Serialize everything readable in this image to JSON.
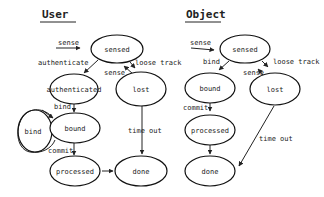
{
  "diagrams": [
    {
      "title": "User",
      "states": {
        "sensed": "sensed",
        "authenticated": "authenticated",
        "lost": "lost",
        "bind": "bind",
        "bound": "bound",
        "processed": "processed",
        "done": "done"
      },
      "transitions": {
        "sense_in": "sense",
        "authenticate": "authenticate",
        "loose_track": "loose track",
        "sense_back": "sense",
        "bind": "bind",
        "commit": "commit",
        "time_out": "time out"
      }
    },
    {
      "title": "Object",
      "states": {
        "sensed": "sensed",
        "bound": "bound",
        "lost": "lost",
        "processed": "processed",
        "done": "done"
      },
      "transitions": {
        "sense_in": "sense",
        "bind": "bind",
        "loose_track": "loose track",
        "sense_back": "sense",
        "commit": "commit",
        "time_out": "time out"
      }
    }
  ]
}
